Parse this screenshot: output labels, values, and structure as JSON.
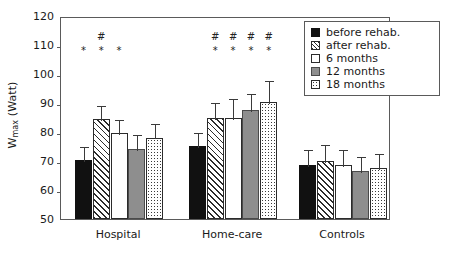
{
  "chart_data": {
    "type": "bar",
    "title": "",
    "subtitle": "",
    "xlabel": "",
    "ylabel": "Wmax (Watt)",
    "ylabel_main": "W",
    "ylabel_sub": "max",
    "ylabel_unit": " (Watt)",
    "ylim": [
      50,
      120
    ],
    "yticks": [
      50,
      60,
      70,
      80,
      90,
      100,
      110,
      120
    ],
    "ytick_labels": [
      "50",
      "60",
      "70",
      "80",
      "90",
      "100",
      "110",
      "120"
    ],
    "grid": false,
    "legend_position": "top-right",
    "categories": [
      "Hospital",
      "Home-care",
      "Controls"
    ],
    "series": [
      {
        "name": "before rehab.",
        "pattern": "solid-black",
        "values": [
          70.5,
          75.2,
          68.5
        ],
        "errors": [
          5.0,
          5.2,
          6.0
        ]
      },
      {
        "name": "after rehab.",
        "pattern": "diagonal-hatch",
        "values": [
          84.5,
          84.8,
          70.0
        ],
        "errors": [
          5.2,
          6.0,
          6.3
        ]
      },
      {
        "name": "6 months",
        "pattern": "white-open",
        "values": [
          79.5,
          84.9,
          68.6
        ],
        "errors": [
          5.5,
          7.2,
          5.9
        ]
      },
      {
        "name": "12 months",
        "pattern": "solid-gray",
        "values": [
          74.3,
          87.7,
          66.5
        ],
        "errors": [
          5.2,
          6.2,
          5.7
        ]
      },
      {
        "name": "18 months",
        "pattern": "dotted",
        "values": [
          78.1,
          90.5,
          67.6
        ],
        "errors": [
          5.3,
          7.8,
          5.5
        ]
      }
    ],
    "annotations": {
      "hash_symbol": "#",
      "star_symbol": "*",
      "Hospital": {
        "hash": [
          "after rehab."
        ],
        "star": [
          "before rehab.",
          "after rehab.",
          "6 months"
        ]
      },
      "Home-care": {
        "hash": [
          "after rehab.",
          "6 months",
          "12 months",
          "18 months"
        ],
        "star": [
          "after rehab.",
          "6 months",
          "12 months",
          "18 months"
        ]
      },
      "Controls": {
        "hash": [],
        "star": []
      }
    }
  },
  "legend": {
    "items": [
      {
        "label": "before rehab."
      },
      {
        "label": "after rehab."
      },
      {
        "label": "6 months"
      },
      {
        "label": "12 months"
      },
      {
        "label": "18 months"
      }
    ]
  },
  "axis": {
    "y_title_main": "W",
    "y_title_sub": "max",
    "y_title_unit": " (Watt)"
  }
}
